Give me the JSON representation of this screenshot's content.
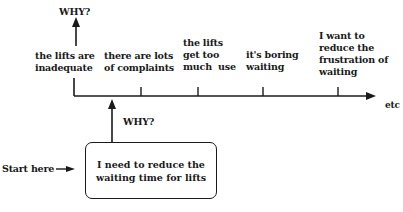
{
  "diagram": {
    "type": "why-ladder",
    "top_why_label": "WHY?",
    "mid_why_label": "WHY?",
    "start_label": "Start here",
    "start_box_text": "I need to reduce the\nwaiting time for lifts",
    "axis_end_label": "etc",
    "steps": [
      {
        "text": "the lifts are\ninadequate"
      },
      {
        "text": "there are lots\nof complaints"
      },
      {
        "text": "the lifts\nget too\nmuch  use"
      },
      {
        "text": "it's boring\nwaiting"
      },
      {
        "text": "I want to\nreduce the\nfrustration of\nwaiting"
      }
    ]
  }
}
